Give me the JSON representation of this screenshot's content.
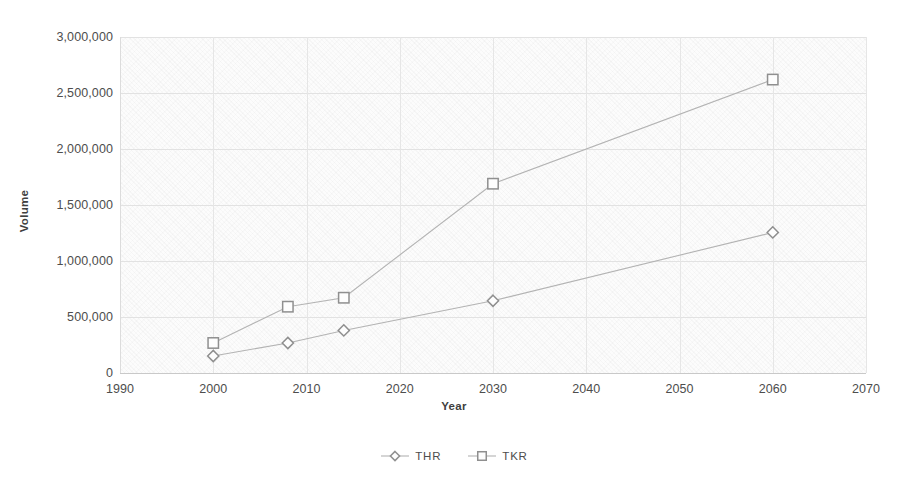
{
  "chart_data": {
    "type": "line",
    "title": "",
    "xlabel": "Year",
    "ylabel": "Volume",
    "x": [
      2000,
      2008,
      2014,
      2030,
      2060
    ],
    "xlim": [
      1990,
      2070
    ],
    "ylim": [
      0,
      3000000
    ],
    "xticks": [
      "1990",
      "2000",
      "2010",
      "2020",
      "2030",
      "2040",
      "2050",
      "2060",
      "2070"
    ],
    "xtick_values": [
      1990,
      2000,
      2010,
      2020,
      2030,
      2040,
      2050,
      2060,
      2070
    ],
    "yticks": [
      "0",
      "500,000",
      "1,000,000",
      "1,500,000",
      "2,000,000",
      "2,500,000",
      "3,000,000"
    ],
    "ytick_values": [
      0,
      500000,
      1000000,
      1500000,
      2000000,
      2500000,
      3000000
    ],
    "grid": true,
    "legend_position": "bottom",
    "series": [
      {
        "name": "THR",
        "marker": "diamond",
        "color": "#b3b3b3",
        "values": [
          152000,
          268000,
          380000,
          645000,
          1255000
        ]
      },
      {
        "name": "TKR",
        "marker": "square",
        "color": "#b3b3b3",
        "values": [
          268000,
          592000,
          672000,
          1690000,
          2620000
        ]
      }
    ]
  },
  "legend": {
    "items": [
      {
        "label": "THR",
        "marker": "diamond"
      },
      {
        "label": "TKR",
        "marker": "square"
      }
    ]
  },
  "axes": {
    "x_title": "Year",
    "y_title": "Volume"
  },
  "colors": {
    "line": "#b3b3b3",
    "marker_stroke": "#8f8f8f",
    "marker_fill": "#fdfdfd",
    "gridline": "#e2e2e2",
    "axis_text": "#4d4d4d",
    "title_text": "#3f3f3f",
    "plot_background": "#fcfcfc"
  }
}
